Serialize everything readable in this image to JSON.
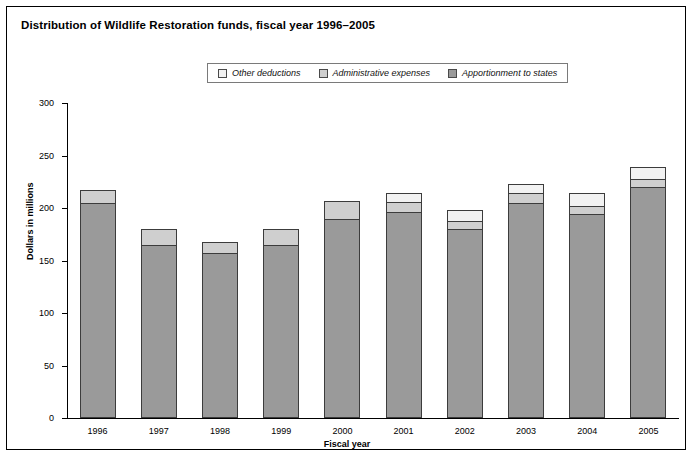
{
  "title": "Distribution of Wildlife Restoration funds, fiscal year 1996–2005",
  "legend": {
    "position": "top-center",
    "items": [
      {
        "label": "Other deductions",
        "color": "#f2f2f2"
      },
      {
        "label": "Administrative expenses",
        "color": "#cfcfcf"
      },
      {
        "label": "Apportionment to states",
        "color": "#9a9a9a"
      }
    ]
  },
  "chart_data": {
    "type": "bar",
    "stacked": true,
    "title": "Distribution of Wildlife Restoration funds, fiscal year 1996–2005",
    "xlabel": "Fiscal year",
    "ylabel": "Dollars in millions",
    "categories": [
      "1996",
      "1997",
      "1998",
      "1999",
      "2000",
      "2001",
      "2002",
      "2003",
      "2004",
      "2005"
    ],
    "ylim": [
      0,
      300
    ],
    "yticks": [
      0,
      50,
      100,
      150,
      200,
      250,
      300
    ],
    "ytick_labels": [
      "0",
      "50",
      "100",
      "150",
      "200",
      "250",
      "300"
    ],
    "grid": false,
    "series": [
      {
        "name": "Apportionment to states",
        "color": "#9a9a9a",
        "values": [
          205,
          165,
          157,
          165,
          190,
          196,
          180,
          205,
          194,
          220
        ]
      },
      {
        "name": "Administrative expenses",
        "color": "#cfcfcf",
        "values": [
          13,
          16,
          12,
          16,
          18,
          11,
          9,
          10,
          9,
          9
        ]
      },
      {
        "name": "Other deductions",
        "color": "#f2f2f2",
        "values": [
          0,
          0,
          0,
          0,
          0,
          9,
          11,
          10,
          13,
          12
        ]
      }
    ],
    "totals": [
      218,
      181,
      169,
      181,
      208,
      216,
      200,
      225,
      216,
      241
    ]
  },
  "footnote": ""
}
